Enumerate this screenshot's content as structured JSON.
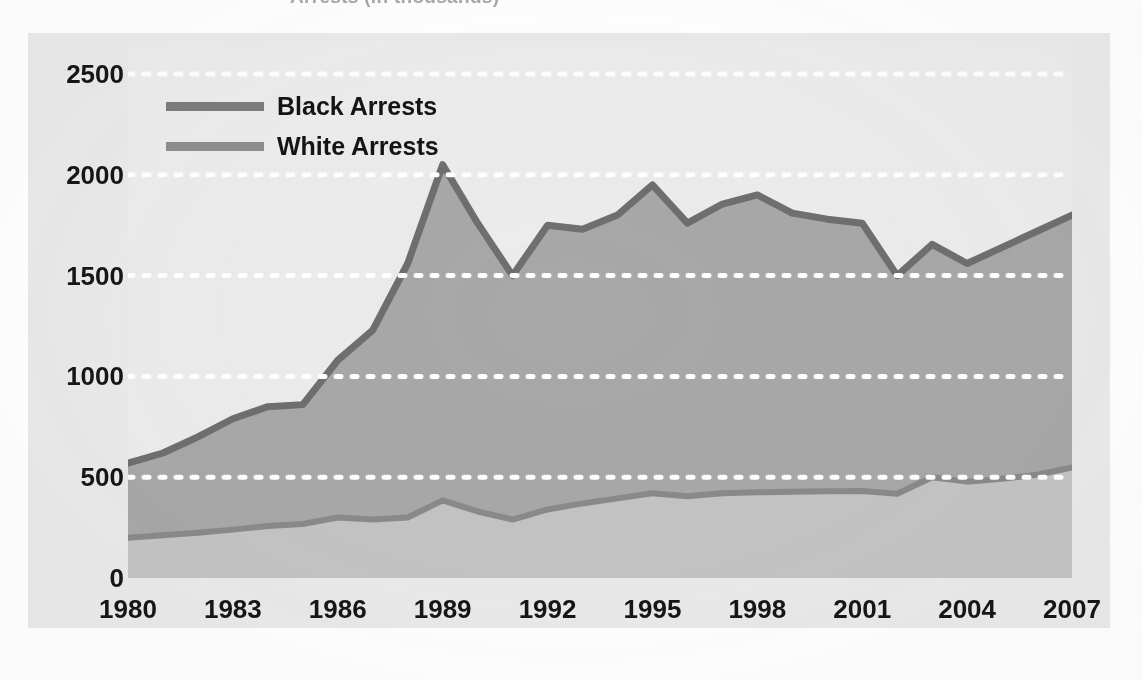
{
  "title": {
    "text": "Arrests (in thousands)",
    "visible_fragment": "cut off at top edge of scan"
  },
  "legend": {
    "position": "inside-top-left",
    "items": [
      {
        "label": "Black Arrests",
        "color": "#7c7c7c",
        "swatch": "line-swatch"
      },
      {
        "label": "White Arrests",
        "color": "#8e8e8e",
        "swatch": "line-swatch"
      }
    ]
  },
  "axes": {
    "y_ticks": [
      "2500",
      "2000",
      "1500",
      "1000",
      "500",
      "0"
    ],
    "x_ticks": [
      "1980",
      "1983",
      "1986",
      "1989",
      "1992",
      "1995",
      "1998",
      "2001",
      "2004",
      "2007"
    ]
  },
  "colors": {
    "panel_background": "#eaeaea",
    "plot_background": "#ececec",
    "black_series_fill": "#a8a8a8",
    "black_series_line": "#6f6f6f",
    "white_series_fill": "#c4c4c4",
    "white_series_line": "#8a8a8a",
    "gridline": "#ffffff",
    "text": "#161616"
  },
  "chart_data": {
    "type": "area",
    "stacked": true,
    "title": "Arrests (in thousands)",
    "xlabel": "",
    "ylabel": "",
    "xlim": [
      1980,
      2007
    ],
    "ylim": [
      0,
      2500
    ],
    "grid": "horizontal-dotted-white",
    "legend_position": "top-left-inside",
    "x": [
      1980,
      1981,
      1982,
      1983,
      1984,
      1985,
      1986,
      1987,
      1988,
      1989,
      1990,
      1991,
      1992,
      1993,
      1994,
      1995,
      1996,
      1997,
      1998,
      1999,
      2000,
      2001,
      2002,
      2003,
      2004,
      2005,
      2006,
      2007
    ],
    "series": [
      {
        "name": "White Arrests",
        "color": "#8a8a8a",
        "fill": "#c4c4c4",
        "values": [
          200,
          212,
          225,
          240,
          258,
          268,
          300,
          290,
          300,
          385,
          330,
          290,
          340,
          370,
          395,
          420,
          405,
          420,
          425,
          428,
          430,
          432,
          418,
          500,
          478,
          492,
          512,
          548
        ]
      },
      {
        "name": "Black Arrests",
        "color": "#6f6f6f",
        "fill": "#a8a8a8",
        "values": [
          570,
          620,
          700,
          790,
          850,
          860,
          1080,
          1230,
          1560,
          2050,
          1760,
          1500,
          1750,
          1730,
          1800,
          1950,
          1760,
          1855,
          1900,
          1810,
          1780,
          1760,
          1500,
          1655,
          1560,
          1640,
          1720,
          1800
        ]
      }
    ],
    "notes": [
      "Values are plotted as a stacked area; the upper boundary is Black Arrests total.",
      "Peak of Black Arrests occurs in 1989 at about 2050.",
      "Local minima of Black Arrests occur in 1991 and 2002 at about 1500."
    ]
  }
}
